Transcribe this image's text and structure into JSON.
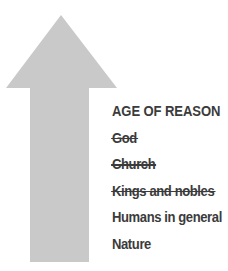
{
  "figure": {
    "background_color": "#ffffff",
    "arrow": {
      "name": "upward-arrow",
      "direction": "up",
      "fill_color": "#c9c9c9",
      "meaning": "order of authority rising"
    },
    "text_color": "#3b3b3b"
  },
  "labels": [
    {
      "text": "AGE OF REASON",
      "struck": false
    },
    {
      "text": "God",
      "struck": true
    },
    {
      "text": "Church",
      "struck": true
    },
    {
      "text": "Kings and nobles",
      "struck": true
    },
    {
      "text": "Humans in general",
      "struck": false
    },
    {
      "text": "Nature",
      "struck": false
    }
  ]
}
